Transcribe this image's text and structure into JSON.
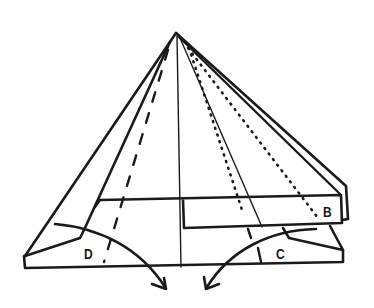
{
  "diagram": {
    "type": "origami-fold-instruction",
    "stroke_color": "#1a1a1a",
    "background": "#ffffff",
    "labels": [
      {
        "id": "B",
        "text": "B",
        "x": 323,
        "y": 204
      },
      {
        "id": "C",
        "text": "C",
        "x": 276,
        "y": 246
      },
      {
        "id": "D",
        "text": "D",
        "x": 84,
        "y": 246
      }
    ],
    "arrows": [
      {
        "name": "fold-arrow-left",
        "from_label": "D",
        "direction": "down-right"
      },
      {
        "name": "fold-arrow-right",
        "from_label": "C",
        "direction": "down-left"
      }
    ],
    "line_styles": {
      "solid": "edge / existing crease",
      "dashed": "valley fold",
      "dotted": "hidden / x-ray line"
    }
  }
}
